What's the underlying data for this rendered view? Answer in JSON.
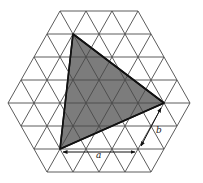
{
  "figure": {
    "lattice": {
      "side": 26,
      "row_height": 23,
      "center_x": 99,
      "top_y": 11,
      "row_segments": [
        3,
        4,
        5,
        6,
        7,
        6,
        5,
        4
      ]
    },
    "shaded_triangle": {
      "vertices": [
        [
          73,
          34
        ],
        [
          164,
          103
        ],
        [
          60,
          149
        ]
      ],
      "fill": "#7c7c7c",
      "stroke": "#111111"
    },
    "vectors": [
      {
        "label": "a",
        "from": [
          63,
          152
        ],
        "to": [
          135,
          152
        ],
        "label_pos": [
          96,
          158
        ],
        "length_units": 3
      },
      {
        "label": "b",
        "from": [
          161,
          108
        ],
        "to": [
          141,
          146
        ],
        "label_pos": [
          156,
          133
        ],
        "length_units": 2
      }
    ],
    "colors": {
      "grid": "#4a4a4a",
      "fill": "#7c7c7c",
      "outline": "#111111",
      "background": "#ffffff"
    }
  }
}
